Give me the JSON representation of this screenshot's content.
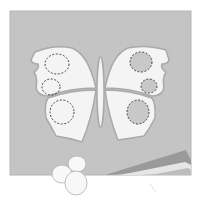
{
  "illustration": {
    "subject": "butterfly paper craft",
    "colors": {
      "background": "#ffffff",
      "paper": "#c4c4c4",
      "paper_edge": "#b8b8b8",
      "wing": "#f4f4f4",
      "wing_outline": "#a9a9a9",
      "spot_fill_right": "#c8c8c8",
      "spot_dash": "#333333",
      "cotton": "#f8f8f8",
      "cotton_outline": "#b0b0b0",
      "strip_dark": "#9a9a9a",
      "strip_mid": "#bdbdbd",
      "strip_light": "#e6e6e6"
    },
    "left_wing_spots": [
      {
        "cx": 57,
        "cy": 62,
        "rx": 12,
        "ry": 10,
        "filled": false
      },
      {
        "cx": 51,
        "cy": 86,
        "rx": 9,
        "ry": 8,
        "filled": false
      },
      {
        "cx": 62,
        "cy": 112,
        "rx": 12,
        "ry": 12,
        "filled": false
      }
    ],
    "right_wing_spots": [
      {
        "cx": 142,
        "cy": 62,
        "rx": 11,
        "ry": 10,
        "filled": true
      },
      {
        "cx": 149,
        "cy": 86,
        "rx": 8,
        "ry": 7,
        "filled": true
      },
      {
        "cx": 138,
        "cy": 112,
        "rx": 11,
        "ry": 12,
        "filled": true
      }
    ]
  }
}
